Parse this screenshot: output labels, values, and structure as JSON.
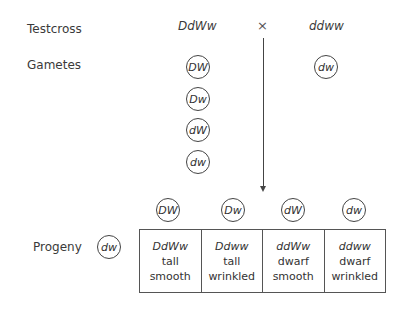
{
  "labels": {
    "testcross": "Testcross",
    "gametes": "Gametes",
    "progeny": "Progeny"
  },
  "parents": {
    "left": "DdWw",
    "cross_symbol": "×",
    "right": "ddww"
  },
  "gametes": {
    "left": [
      "DW",
      "Dw",
      "dW",
      "dw"
    ],
    "right": [
      "dw"
    ]
  },
  "progeny": {
    "column_gametes": [
      "DW",
      "Dw",
      "dW",
      "dw"
    ],
    "row_gamete": "dw",
    "cells": [
      {
        "genotype": "DdWw",
        "height": "tall",
        "seed": "smooth"
      },
      {
        "genotype": "Ddww",
        "height": "tall",
        "seed": "wrinkled"
      },
      {
        "genotype": "ddWw",
        "height": "dwarf",
        "seed": "smooth"
      },
      {
        "genotype": "ddww",
        "height": "dwarf",
        "seed": "wrinkled"
      }
    ]
  }
}
